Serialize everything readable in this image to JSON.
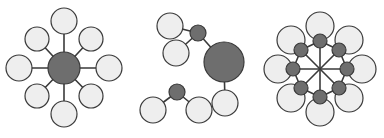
{
  "figure": {
    "background_color": "#ffffff",
    "width": 384,
    "height": 138
  },
  "palette": {
    "light_atom_fill": "#eeeeee",
    "dark_atom_fill": "#6e6e6e",
    "outline": "#3a3a3a",
    "bond": "#3a3a3a"
  },
  "chart_data": {
    "type": "diagram",
    "panels": [
      {
        "id": "panel-left",
        "name": "eight-coordinate-star",
        "description": "One large dark central atom bonded radially to eight light satellite atoms arranged at 45 degree intervals",
        "atoms": [
          {
            "id": "L-center",
            "kind": "dark",
            "cx": 64,
            "cy": 68,
            "r": 16
          },
          {
            "id": "L-n",
            "kind": "light",
            "cx": 64,
            "cy": 21,
            "r": 13
          },
          {
            "id": "L-ne",
            "kind": "light",
            "cx": 91,
            "cy": 39,
            "r": 12
          },
          {
            "id": "L-e",
            "kind": "light",
            "cx": 109,
            "cy": 68,
            "r": 13
          },
          {
            "id": "L-se",
            "kind": "light",
            "cx": 91,
            "cy": 96,
            "r": 12
          },
          {
            "id": "L-s",
            "kind": "light",
            "cx": 64,
            "cy": 114,
            "r": 13
          },
          {
            "id": "L-sw",
            "kind": "light",
            "cx": 37,
            "cy": 96,
            "r": 12
          },
          {
            "id": "L-w",
            "kind": "light",
            "cx": 19,
            "cy": 68,
            "r": 13
          },
          {
            "id": "L-nw",
            "kind": "light",
            "cx": 37,
            "cy": 39,
            "r": 12
          }
        ],
        "bonds": [
          {
            "from": "L-center",
            "to": "L-n"
          },
          {
            "from": "L-center",
            "to": "L-ne"
          },
          {
            "from": "L-center",
            "to": "L-e"
          },
          {
            "from": "L-center",
            "to": "L-se"
          },
          {
            "from": "L-center",
            "to": "L-s"
          },
          {
            "from": "L-center",
            "to": "L-sw"
          },
          {
            "from": "L-center",
            "to": "L-w"
          },
          {
            "from": "L-center",
            "to": "L-nw"
          }
        ]
      },
      {
        "id": "panel-middle",
        "name": "two-fragment-molecule",
        "description": "Upper fragment: large dark atom bonded to a small dark atom (which carries two light atoms) and to one light atom below. Lower separate fragment: small dark atom bonded to two light atoms.",
        "atoms": [
          {
            "id": "M-big",
            "kind": "dark",
            "cx": 224,
            "cy": 62,
            "r": 20
          },
          {
            "id": "M-small",
            "kind": "dark",
            "cx": 198,
            "cy": 33,
            "r": 8
          },
          {
            "id": "M-l1",
            "kind": "light",
            "cx": 170,
            "cy": 26,
            "r": 13
          },
          {
            "id": "M-l2",
            "kind": "light",
            "cx": 176,
            "cy": 53,
            "r": 13
          },
          {
            "id": "M-l3",
            "kind": "light",
            "cx": 225,
            "cy": 103,
            "r": 13
          },
          {
            "id": "M-small2",
            "kind": "dark",
            "cx": 177,
            "cy": 92,
            "r": 8
          },
          {
            "id": "M-l4",
            "kind": "light",
            "cx": 153,
            "cy": 110,
            "r": 13
          },
          {
            "id": "M-l5",
            "kind": "light",
            "cx": 199,
            "cy": 110,
            "r": 13
          }
        ],
        "bonds": [
          {
            "from": "M-big",
            "to": "M-small"
          },
          {
            "from": "M-small",
            "to": "M-l1"
          },
          {
            "from": "M-small",
            "to": "M-l2"
          },
          {
            "from": "M-big",
            "to": "M-l3"
          },
          {
            "from": "M-small2",
            "to": "M-l4"
          },
          {
            "from": "M-small2",
            "to": "M-l5"
          }
        ]
      },
      {
        "id": "panel-right",
        "name": "eight-coordinate-capped-star",
        "description": "A central junction point with eight radial bonds at 45 degree intervals; each bond ends in a small dark atom that is capped by a larger light atom further out",
        "center": {
          "cx": 320,
          "cy": 69
        },
        "dark_ring_radius": 22,
        "light_ring_radius": 32,
        "atoms": [
          {
            "id": "R-d-n",
            "kind": "dark",
            "cx": 320,
            "cy": 41,
            "r": 7
          },
          {
            "id": "R-d-ne",
            "kind": "dark",
            "cx": 339,
            "cy": 50,
            "r": 7
          },
          {
            "id": "R-d-e",
            "kind": "dark",
            "cx": 347,
            "cy": 69,
            "r": 7
          },
          {
            "id": "R-d-se",
            "kind": "dark",
            "cx": 339,
            "cy": 88,
            "r": 7
          },
          {
            "id": "R-d-s",
            "kind": "dark",
            "cx": 320,
            "cy": 97,
            "r": 7
          },
          {
            "id": "R-d-sw",
            "kind": "dark",
            "cx": 301,
            "cy": 88,
            "r": 7
          },
          {
            "id": "R-d-w",
            "kind": "dark",
            "cx": 293,
            "cy": 69,
            "r": 7
          },
          {
            "id": "R-d-nw",
            "kind": "dark",
            "cx": 301,
            "cy": 50,
            "r": 7
          },
          {
            "id": "R-l-n",
            "kind": "light",
            "cx": 320,
            "cy": 26,
            "r": 14
          },
          {
            "id": "R-l-ne",
            "kind": "light",
            "cx": 349,
            "cy": 40,
            "r": 14
          },
          {
            "id": "R-l-e",
            "kind": "light",
            "cx": 362,
            "cy": 69,
            "r": 14
          },
          {
            "id": "R-l-se",
            "kind": "light",
            "cx": 349,
            "cy": 98,
            "r": 14
          },
          {
            "id": "R-l-s",
            "kind": "light",
            "cx": 320,
            "cy": 112,
            "r": 14
          },
          {
            "id": "R-l-sw",
            "kind": "light",
            "cx": 291,
            "cy": 98,
            "r": 14
          },
          {
            "id": "R-l-w",
            "kind": "light",
            "cx": 278,
            "cy": 69,
            "r": 14
          },
          {
            "id": "R-l-nw",
            "kind": "light",
            "cx": 291,
            "cy": 40,
            "r": 14
          }
        ],
        "spokes": [
          {
            "to": "R-d-n"
          },
          {
            "to": "R-d-ne"
          },
          {
            "to": "R-d-e"
          },
          {
            "to": "R-d-se"
          },
          {
            "to": "R-d-s"
          },
          {
            "to": "R-d-sw"
          },
          {
            "to": "R-d-w"
          },
          {
            "to": "R-d-nw"
          }
        ],
        "rim_bonds": [
          {
            "from": "R-d-n",
            "to": "R-d-ne"
          },
          {
            "from": "R-d-ne",
            "to": "R-d-e"
          },
          {
            "from": "R-d-e",
            "to": "R-d-se"
          },
          {
            "from": "R-d-se",
            "to": "R-d-s"
          },
          {
            "from": "R-d-s",
            "to": "R-d-sw"
          },
          {
            "from": "R-d-sw",
            "to": "R-d-w"
          },
          {
            "from": "R-d-w",
            "to": "R-d-nw"
          },
          {
            "from": "R-d-nw",
            "to": "R-d-n"
          }
        ]
      }
    ]
  }
}
